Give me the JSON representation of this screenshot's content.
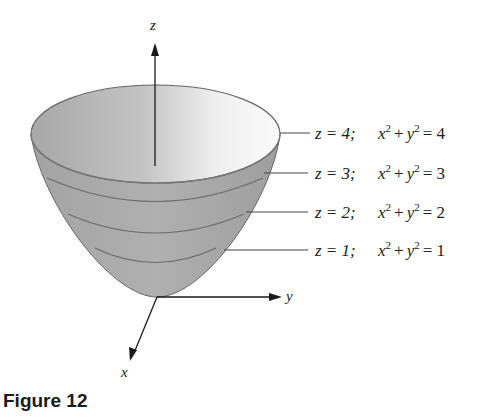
{
  "figure": {
    "caption": "Figure 12",
    "surface": "paraboloid z = x^2 + y^2",
    "axes": {
      "z_label": "z",
      "y_label": "y",
      "x_label": "x"
    },
    "level_curves": [
      {
        "z_eq": "z = 4;",
        "curve_eq_lhs": "x",
        "exp": "2",
        "plus": "+",
        "y": "y",
        "exp2": "2",
        "rhs": "= 4"
      },
      {
        "z_eq": "z = 3;",
        "curve_eq_lhs": "x",
        "exp": "2",
        "plus": "+",
        "y": "y",
        "exp2": "2",
        "rhs": "= 3"
      },
      {
        "z_eq": "z = 2;",
        "curve_eq_lhs": "x",
        "exp": "2",
        "plus": "+",
        "y": "y",
        "exp2": "2",
        "rhs": "= 2"
      },
      {
        "z_eq": "z = 1;",
        "curve_eq_lhs": "x",
        "exp": "2",
        "plus": "+",
        "y": "y",
        "exp2": "2",
        "rhs": "= 1"
      }
    ],
    "colors": {
      "surface_outer": "#a9a9a9",
      "surface_inner_light": "#f2f2f2",
      "line": "#555555",
      "axis": "#1a1a1a"
    }
  }
}
